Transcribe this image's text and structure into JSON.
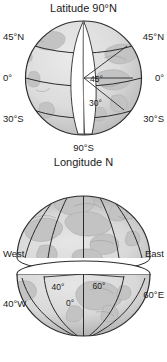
{
  "figure": {
    "title_top": "Latitude 90°N",
    "title_middle": "Longitude N",
    "bottom_pole": "S",
    "background_color": "#ffffff",
    "globe_fill": "#dcdcdc",
    "globe_shadow": "#b9b9b9",
    "land_fill": "#c2c2c2",
    "line_color": "#2b2b2b",
    "text_color": "#1a1a1a",
    "cutout_fill": "#ffffff"
  },
  "globe_top": {
    "name": "latitude-globe",
    "pole_label": "Latitude 90°N",
    "south_pole_label": "90°S",
    "left_labels": [
      "45°N",
      "0°",
      "30°S"
    ],
    "right_labels": [
      "45°N",
      "0°",
      "30°S"
    ],
    "interior_angles": [
      "45°",
      "30°"
    ],
    "parallels": [
      "45°N",
      "0°",
      "30°S"
    ]
  },
  "globe_middle": {
    "name": "longitude-hemisphere",
    "pole_label": "Longitude N",
    "left_label": "West",
    "right_label": "East"
  },
  "globe_bottom": {
    "name": "longitude-bowl",
    "pole_label": "S",
    "left_label": "40°W",
    "center_label": "0°",
    "right_label": "60°E",
    "interior_angles": [
      "40°",
      "60°"
    ]
  }
}
